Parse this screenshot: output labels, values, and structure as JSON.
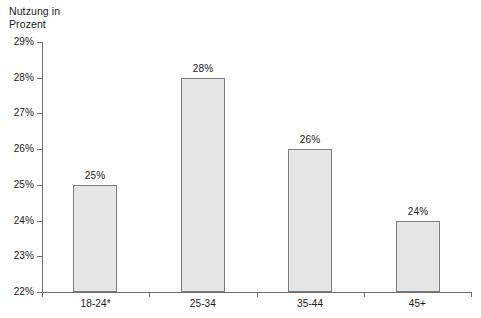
{
  "chart_data": {
    "type": "bar",
    "title": "",
    "subtitle": "",
    "xlabel": "",
    "ylabel": "Nutzung in\nProzent",
    "categories": [
      "18-24*",
      "25-34",
      "35-44",
      "45+"
    ],
    "values": [
      25,
      28,
      26,
      24
    ],
    "value_labels": [
      "25%",
      "28%",
      "26%",
      "24%"
    ],
    "ylim": [
      22,
      29
    ],
    "yticks": [
      22,
      23,
      24,
      25,
      26,
      27,
      28,
      29
    ],
    "ytick_labels": [
      "22%",
      "23%",
      "24%",
      "25%",
      "26%",
      "27%",
      "28%",
      "29%"
    ],
    "grid": false,
    "legend": false,
    "legend_position": "none",
    "series": [
      {
        "name": "Nutzung in Prozent",
        "values": [
          25,
          28,
          26,
          24
        ]
      }
    ],
    "colors": {
      "bar_fill": "#e6e6e6",
      "bar_border": "#7d7d7d",
      "axis": "#6e6e6e",
      "text": "#1a1a1a",
      "background": "#ffffff"
    }
  }
}
